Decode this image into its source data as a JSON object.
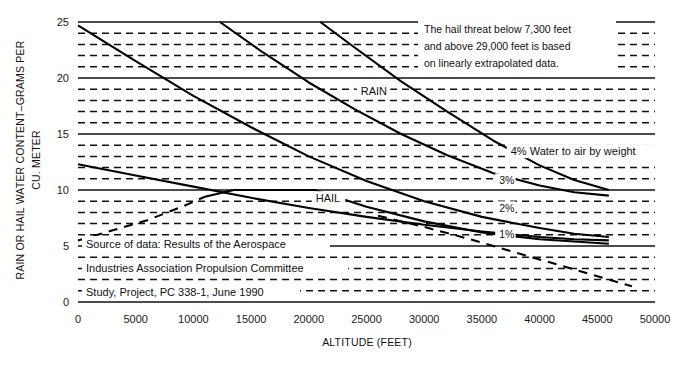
{
  "chart_data": {
    "type": "line",
    "title": "",
    "xlabel": "ALTITUDE (FEET)",
    "ylabel": "RAIN OR HAIL WATER CONTENT–GRAMS PER CU. METER",
    "xlim": [
      0,
      50000
    ],
    "ylim": [
      0,
      25
    ],
    "xticks": [
      0,
      5000,
      10000,
      15000,
      20000,
      25000,
      30000,
      35000,
      40000,
      45000,
      50000
    ],
    "xtick_labels": [
      "0",
      "5000",
      "10000",
      "15000",
      "20000",
      "25000",
      "30000",
      "35000",
      "40000",
      "45000",
      "50000"
    ],
    "yticks": [
      0,
      5,
      10,
      15,
      20,
      25
    ],
    "ytick_labels": [
      "0",
      "5",
      "10",
      "15",
      "20",
      "25"
    ],
    "grid": "major solid at every 5 units, minor dashed at every 1 unit",
    "legend_position": "inline annotations on curves",
    "series": [
      {
        "name": "4% Water to air by weight",
        "label": "4%",
        "style": "solid",
        "points": [
          [
            12300,
            25.0
          ],
          [
            16000,
            22.3
          ],
          [
            20000,
            19.6
          ],
          [
            24000,
            17.2
          ],
          [
            28000,
            15.0
          ],
          [
            32000,
            13.1
          ],
          [
            36000,
            11.5
          ],
          [
            40000,
            10.4
          ],
          [
            43000,
            9.8
          ],
          [
            46000,
            9.5
          ]
        ]
      },
      {
        "name": "3%",
        "label": "3%",
        "style": "solid",
        "points": [
          [
            21000,
            25.0
          ],
          [
            24000,
            22.7
          ],
          [
            28000,
            19.7
          ],
          [
            32000,
            17.0
          ],
          [
            36000,
            14.4
          ],
          [
            40000,
            12.2
          ],
          [
            43000,
            10.9
          ],
          [
            46000,
            10.0
          ]
        ]
      },
      {
        "name": "2%",
        "label": "2%",
        "style": "solid",
        "points": [
          [
            0,
            24.7
          ],
          [
            5000,
            21.5
          ],
          [
            10000,
            18.4
          ],
          [
            15000,
            15.6
          ],
          [
            20000,
            13.0
          ],
          [
            25000,
            10.8
          ],
          [
            30000,
            9.0
          ],
          [
            35000,
            7.6
          ],
          [
            40000,
            6.6
          ],
          [
            43000,
            6.1
          ],
          [
            46000,
            5.8
          ]
        ]
      },
      {
        "name": "1%",
        "label": "1%",
        "style": "solid",
        "points": [
          [
            0,
            12.3
          ],
          [
            5000,
            11.3
          ],
          [
            10000,
            10.3
          ],
          [
            15000,
            9.3
          ],
          [
            20000,
            8.4
          ],
          [
            25000,
            7.6
          ],
          [
            30000,
            6.9
          ],
          [
            35000,
            6.3
          ],
          [
            40000,
            5.8
          ],
          [
            43000,
            5.6
          ],
          [
            46000,
            5.5
          ]
        ]
      },
      {
        "name": "HAIL",
        "label": "HAIL",
        "style": "solid",
        "points": [
          [
            11000,
            9.4
          ],
          [
            13500,
            10.0
          ],
          [
            20500,
            10.0
          ],
          [
            25000,
            8.5
          ],
          [
            30000,
            7.2
          ],
          [
            35000,
            6.2
          ],
          [
            40000,
            5.6
          ],
          [
            46000,
            5.2
          ]
        ]
      },
      {
        "name": "HAIL extrapolated",
        "label": "",
        "style": "dashed",
        "points": [
          [
            0,
            5.5
          ],
          [
            3000,
            6.4
          ],
          [
            6000,
            7.3
          ],
          [
            9000,
            8.5
          ],
          [
            11000,
            9.4
          ]
        ]
      },
      {
        "name": "RAIN extrapolated upper",
        "label": "",
        "style": "dashed",
        "points": [
          [
            26000,
            7.7
          ],
          [
            30000,
            6.7
          ],
          [
            34000,
            5.6
          ],
          [
            38000,
            4.4
          ],
          [
            42000,
            3.2
          ],
          [
            46000,
            2.0
          ],
          [
            48000,
            1.4
          ]
        ]
      }
    ],
    "series_annotations": [
      {
        "text": "RAIN",
        "x": 24500,
        "y": 18.6
      },
      {
        "text": "HAIL",
        "x": 20600,
        "y": 9.0
      },
      {
        "text": "4% Water to air by weight",
        "x": 37500,
        "y": 13.2
      },
      {
        "text": "3%",
        "x": 36500,
        "y": 10.6
      },
      {
        "text": "2%",
        "x": 36500,
        "y": 8.1
      },
      {
        "text": "1%",
        "x": 36500,
        "y": 5.8
      }
    ],
    "note_lines": [
      "The hail threat below 7,300 feet",
      "and above 29,000 feet is based",
      "on linearly extrapolated data."
    ],
    "source_lines": [
      "Source of data: Results of the Aerospace",
      "Industries Association Propulsion Committee",
      "Study, Project, PC 338-1, June 1990"
    ],
    "colors": {
      "line": "#000000",
      "grid": "#111111",
      "background": "#ffffff",
      "text": "#111111"
    }
  }
}
